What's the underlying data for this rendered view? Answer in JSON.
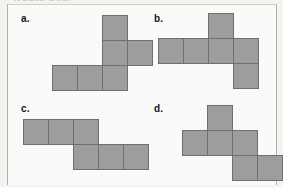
{
  "page": {
    "clipped_header_text": "to answer to this?",
    "background_color": "#f4f3f0",
    "card_color": "#fbfaf8"
  },
  "style": {
    "cell_fill": "#9d9d9d",
    "cell_stroke": "#6f6f6f",
    "cell_size_px": 26
  },
  "options": [
    {
      "label": "a.",
      "name": "option-a",
      "cells": [
        {
          "col": 3,
          "row": 0
        },
        {
          "col": 3,
          "row": 1
        },
        {
          "col": 4,
          "row": 1
        },
        {
          "col": 1,
          "row": 2
        },
        {
          "col": 2,
          "row": 2
        },
        {
          "col": 3,
          "row": 2
        }
      ]
    },
    {
      "label": "b.",
      "name": "option-b",
      "cells": [
        {
          "col": 2,
          "row": 0
        },
        {
          "col": 0,
          "row": 1
        },
        {
          "col": 1,
          "row": 1
        },
        {
          "col": 2,
          "row": 1
        },
        {
          "col": 3,
          "row": 1
        },
        {
          "col": 3,
          "row": 2
        }
      ]
    },
    {
      "label": "c.",
      "name": "option-c",
      "cells": [
        {
          "col": 0,
          "row": 0
        },
        {
          "col": 1,
          "row": 0
        },
        {
          "col": 2,
          "row": 0
        },
        {
          "col": 2,
          "row": 1
        },
        {
          "col": 3,
          "row": 1
        },
        {
          "col": 4,
          "row": 1
        }
      ]
    },
    {
      "label": "d.",
      "name": "option-d",
      "cells": [
        {
          "col": 1,
          "row": 0
        },
        {
          "col": 0,
          "row": 1
        },
        {
          "col": 1,
          "row": 1
        },
        {
          "col": 2,
          "row": 1
        },
        {
          "col": 2,
          "row": 2
        },
        {
          "col": 3,
          "row": 2
        }
      ]
    }
  ]
}
